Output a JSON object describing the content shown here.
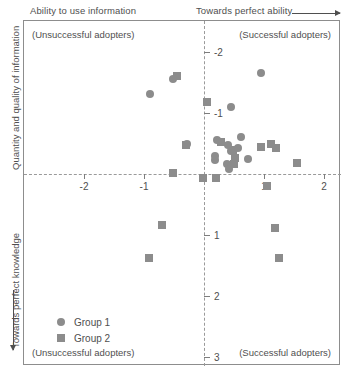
{
  "captions": {
    "top_left": "Ability to use information",
    "top_right": "Towards perfect ability",
    "left_upper": "Quantity and quality of information",
    "left_lower": "Towards perfect knowledge"
  },
  "quadrants": {
    "top_left": "(Unsuccessful adopters)",
    "top_right": "(Successful adopters)",
    "bottom_left": "(Unsuccessful adopters)",
    "bottom_right": "(Successful adopters)"
  },
  "legend": {
    "items": [
      {
        "label": "Group 1",
        "marker": "circle",
        "color": "#8c8c8c"
      },
      {
        "label": "Group 2",
        "marker": "square",
        "color": "#8c8c8c"
      }
    ]
  },
  "axes": {
    "x_ticks": [
      "-2",
      "-1",
      "1",
      "2"
    ],
    "y_ticks": [
      "-2",
      "-1",
      "1",
      "2",
      "3"
    ]
  },
  "chart_data": {
    "type": "scatter",
    "title": "",
    "xlabel": "Ability to use information",
    "ylabel": "Quantity and quality of information",
    "xlim": [
      -2.95,
      2.3
    ],
    "ylim": [
      -2.5,
      3.15
    ],
    "y_axis_inverted": true,
    "grid": false,
    "legend_position": "lower-left-inside",
    "x_tick_values": [
      -2,
      -1,
      1,
      2
    ],
    "y_tick_values": [
      -2,
      -1,
      1,
      2,
      3
    ],
    "annotations": [
      "(Unsuccessful adopters)",
      "(Successful adopters)",
      "(Unsuccessful adopters)",
      "(Successful adopters)"
    ],
    "series": [
      {
        "name": "Group 1",
        "marker": "circle",
        "color": "#8c8c8c",
        "points": [
          [
            -0.52,
            -1.56
          ],
          [
            -0.9,
            -1.31
          ],
          [
            0.95,
            -1.65
          ],
          [
            0.45,
            -1.1
          ],
          [
            -0.28,
            -0.5
          ],
          [
            0.22,
            -0.55
          ],
          [
            0.18,
            -0.23
          ],
          [
            0.19,
            -0.3
          ],
          [
            0.4,
            -0.48
          ],
          [
            0.45,
            -0.38
          ],
          [
            0.38,
            -0.17
          ],
          [
            0.42,
            -0.08
          ],
          [
            0.62,
            -0.6
          ],
          [
            0.57,
            -0.42
          ],
          [
            0.73,
            -0.25
          ]
        ]
      },
      {
        "name": "Group 2",
        "marker": "square",
        "color": "#8c8c8c",
        "points": [
          [
            -0.45,
            -1.6
          ],
          [
            0.05,
            -1.18
          ],
          [
            -0.3,
            -0.47
          ],
          [
            -0.52,
            -0.02
          ],
          [
            0.28,
            -0.52
          ],
          [
            0.48,
            -0.4
          ],
          [
            0.52,
            -0.27
          ],
          [
            0.5,
            -0.16
          ],
          [
            0.95,
            -0.45
          ],
          [
            1.12,
            -0.5
          ],
          [
            1.2,
            -0.42
          ],
          [
            1.55,
            -0.18
          ],
          [
            -0.02,
            0.07
          ],
          [
            0.2,
            0.07
          ],
          [
            1.05,
            0.2
          ],
          [
            -0.7,
            0.83
          ],
          [
            1.18,
            0.88
          ],
          [
            -0.92,
            1.38
          ],
          [
            1.25,
            1.38
          ]
        ]
      }
    ]
  }
}
